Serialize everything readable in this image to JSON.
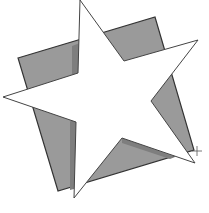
{
  "figure": {
    "width": 209,
    "height": 213,
    "background": "#ffffff",
    "square": {
      "fill": "#9a9a9a",
      "shade": "#7e7e7e",
      "stroke": "#333333",
      "points": "18,58 155,17 194,150 58,191"
    },
    "star": {
      "fill": "#ffffff",
      "stroke": "#444444",
      "points": "80,0 124,61 198,40 151,101 195,163 122,138 74,198 76,122 3,97 78,73"
    },
    "cursor": {
      "x": 197,
      "y": 151,
      "icon": "crosshair-icon"
    }
  }
}
